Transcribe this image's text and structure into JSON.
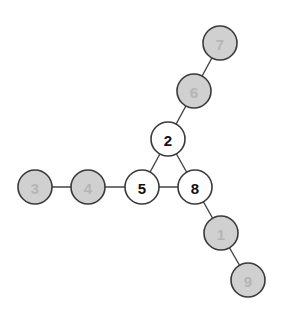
{
  "graph": {
    "node_radius": 17,
    "styles": {
      "highlighted": {
        "fill": "#ffffff",
        "text": "#111111"
      },
      "dimmed": {
        "fill": "#d0d0d0",
        "text": "#b5b5b5"
      }
    },
    "nodes": [
      {
        "id": "7",
        "label": "7",
        "x": 220,
        "y": 43,
        "style": "dimmed"
      },
      {
        "id": "6",
        "label": "6",
        "x": 194,
        "y": 91,
        "style": "dimmed"
      },
      {
        "id": "2",
        "label": "2",
        "x": 168,
        "y": 139,
        "style": "highlighted"
      },
      {
        "id": "5",
        "label": "5",
        "x": 142,
        "y": 187,
        "style": "highlighted"
      },
      {
        "id": "8",
        "label": "8",
        "x": 195,
        "y": 187,
        "style": "highlighted"
      },
      {
        "id": "4",
        "label": "4",
        "x": 88,
        "y": 187,
        "style": "dimmed"
      },
      {
        "id": "3",
        "label": "3",
        "x": 35,
        "y": 187,
        "style": "dimmed"
      },
      {
        "id": "1",
        "label": "1",
        "x": 221,
        "y": 233,
        "style": "dimmed"
      },
      {
        "id": "9",
        "label": "9",
        "x": 248,
        "y": 280,
        "style": "dimmed"
      }
    ],
    "edges": [
      [
        "7",
        "6"
      ],
      [
        "6",
        "2"
      ],
      [
        "2",
        "5"
      ],
      [
        "2",
        "8"
      ],
      [
        "5",
        "8"
      ],
      [
        "4",
        "5"
      ],
      [
        "3",
        "4"
      ],
      [
        "8",
        "1"
      ],
      [
        "1",
        "9"
      ]
    ]
  }
}
